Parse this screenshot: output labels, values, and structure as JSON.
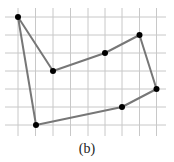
{
  "figure": {
    "caption": "(b)",
    "grid": {
      "color": "#c8c8c8",
      "x_lines": [
        18,
        35.5,
        53,
        70.5,
        88,
        105,
        122,
        139.5,
        156.5
      ],
      "y_lines": [
        17,
        35,
        53,
        71,
        89,
        107,
        125
      ],
      "x_extent": [
        5,
        166
      ],
      "y_extent": [
        8,
        136
      ]
    },
    "polygon": {
      "stroke": "#777777",
      "stroke_width": 2,
      "vertex_color": "#000000",
      "vertex_radius": 3,
      "vertices": [
        {
          "x": 18,
          "y": 17
        },
        {
          "x": 53,
          "y": 71
        },
        {
          "x": 105,
          "y": 53
        },
        {
          "x": 139.5,
          "y": 35
        },
        {
          "x": 156.5,
          "y": 89
        },
        {
          "x": 122,
          "y": 107
        },
        {
          "x": 36,
          "y": 125
        }
      ]
    }
  }
}
